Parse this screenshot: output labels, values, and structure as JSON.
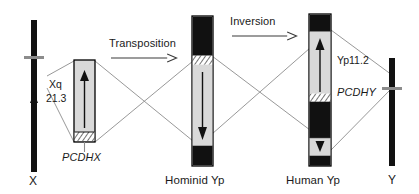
{
  "figure": {
    "type": "chromosome-rearrangement-diagram",
    "background_color": "#ffffff",
    "width": 419,
    "height": 194
  },
  "palette": {
    "black": "#000000",
    "dark_band": "#111111",
    "light_band": "#d9d9d9",
    "pale_band": "#e8e8e8",
    "connector": "#8c8c8c",
    "outline": "#000000",
    "text": "#1a1a1a"
  },
  "chromosomes": {
    "x": {
      "caption": "X",
      "kind": "ideogram-bar",
      "orientation_arrow": "up"
    },
    "x_region": {
      "band_label_line1": "Xq",
      "band_label_line2": "21.3",
      "gene_label": "PCDHX",
      "orientation_arrow": "up",
      "hatch_position": "bottom"
    },
    "hominid_yp": {
      "caption": "Hominid Yp",
      "orientation_arrow": "down",
      "hatch_position": "top"
    },
    "human_yp": {
      "caption": "Human Yp",
      "band_label": "Yp11.2",
      "gene_label": "PCDHY",
      "orientation_arrow_upper": "up",
      "orientation_arrow_lower": "down",
      "hatch_position": "middle"
    },
    "y": {
      "caption": "Y",
      "kind": "ideogram-bar"
    }
  },
  "events": [
    {
      "id": "transposition",
      "label": "Transposition",
      "arrow": "right"
    },
    {
      "id": "inversion",
      "label": "Inversion",
      "arrow": "right"
    }
  ]
}
